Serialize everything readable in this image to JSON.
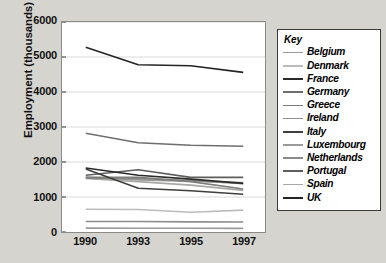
{
  "chart_data": {
    "type": "line",
    "title": "",
    "xlabel": "",
    "ylabel": "Employment (thousands)",
    "categories": [
      "1990",
      "1993",
      "1995",
      "1997"
    ],
    "x_tick_labels": [
      "1990",
      "1993",
      "1995",
      "1997"
    ],
    "y_tick_labels": [
      "0",
      "1000",
      "2000",
      "3000",
      "4000",
      "5000",
      "6000"
    ],
    "y_ticks": [
      0,
      1000,
      2000,
      3000,
      4000,
      5000,
      6000
    ],
    "ylim": [
      0,
      6000
    ],
    "grid": "horizontal",
    "legend_position": "right",
    "legend_title": "Key",
    "series": [
      {
        "name": "Belgium",
        "values": [
          1560,
          1490,
          1450,
          1410
        ],
        "color": "#9a9a98"
      },
      {
        "name": "Denmark",
        "values": [
          650,
          645,
          565,
          625
        ],
        "color": "#bcbcba"
      },
      {
        "name": "France",
        "values": [
          1830,
          1620,
          1510,
          1390
        ],
        "color": "#2b2b2b"
      },
      {
        "name": "Germany",
        "values": [
          2820,
          2550,
          2480,
          2450
        ],
        "color": "#6e6e6c"
      },
      {
        "name": "Greece",
        "values": [
          1560,
          1560,
          1440,
          1230
        ],
        "color": "#7d7d7b"
      },
      {
        "name": "Ireland",
        "values": [
          300,
          300,
          290,
          285
        ],
        "color": "#8d8d8b"
      },
      {
        "name": "Italy",
        "values": [
          1800,
          1250,
          1180,
          1080
        ],
        "color": "#3f3f3d"
      },
      {
        "name": "Luxembourg",
        "values": [
          110,
          108,
          106,
          104
        ],
        "color": "#9a9a98"
      },
      {
        "name": "Netherlands",
        "values": [
          1540,
          1530,
          1470,
          1380
        ],
        "color": "#8a8a88"
      },
      {
        "name": "Portugal",
        "values": [
          1620,
          1780,
          1560,
          1560
        ],
        "color": "#5e5e5c"
      },
      {
        "name": "Spain",
        "values": [
          1530,
          1440,
          1340,
          1190
        ],
        "color": "#a8a8a6"
      },
      {
        "name": "UK",
        "values": [
          5280,
          4780,
          4750,
          4560
        ],
        "color": "#242424"
      }
    ]
  },
  "legend": {
    "title": "Key",
    "items": [
      {
        "label": "Belgium"
      },
      {
        "label": "Denmark"
      },
      {
        "label": "France"
      },
      {
        "label": "Germany"
      },
      {
        "label": "Greece"
      },
      {
        "label": "Ireland"
      },
      {
        "label": "Italy"
      },
      {
        "label": "Luxembourg"
      },
      {
        "label": "Netherlands"
      },
      {
        "label": "Portugal"
      },
      {
        "label": "Spain"
      },
      {
        "label": "UK"
      }
    ]
  },
  "colors": {
    "page_background": "#d6d4cf",
    "plot_background": "#ffffff",
    "gridline": "#d9d9d9",
    "axis": "#3a3a38",
    "text": "#111111"
  }
}
